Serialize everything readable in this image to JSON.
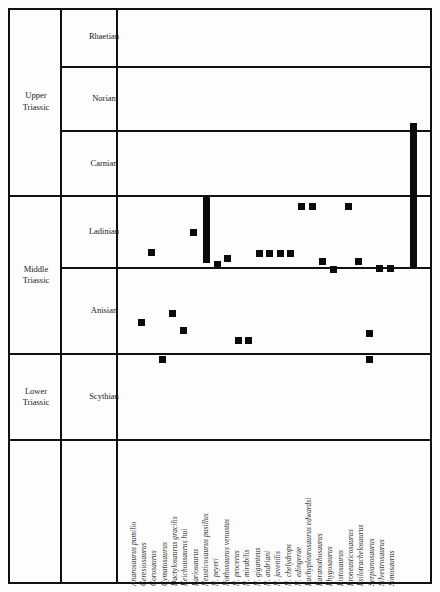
{
  "figure": {
    "background_color": "#fdfdfd",
    "line_color": "#111111",
    "mark_color": "#0b0b0b"
  },
  "axis": {
    "epochs": [
      {
        "name": "Upper\nTriassic",
        "label": "Upper Triassic",
        "line1": "Upper",
        "line2": "Triassic",
        "top": 10,
        "height": 186
      },
      {
        "name": "Middle\nTriassic",
        "label": "Middle Triassic",
        "line1": "Middle",
        "line2": "Triassic",
        "top": 196,
        "height": 158
      },
      {
        "name": "Lower\nTriassic",
        "label": "Lower Triassic",
        "line1": "Lower",
        "line2": "Triassic",
        "top": 354,
        "height": 86
      }
    ],
    "stages": [
      {
        "label": "Rhaetian",
        "top": 10,
        "height": 58
      },
      {
        "label": "Norian",
        "top": 68,
        "height": 63
      },
      {
        "label": "Carnian",
        "top": 131,
        "height": 65
      },
      {
        "label": "Ladinian",
        "top": 196,
        "height": 72
      },
      {
        "label": "Anisian",
        "top": 268,
        "height": 86
      },
      {
        "label": "Scythian",
        "top": 354,
        "height": 86
      }
    ]
  },
  "chart_data": {
    "type": "range-chart",
    "xlabel": "Taxa",
    "ylabel": "Triassic stages",
    "grid": true,
    "legend": "none",
    "y_categories": [
      "Scythian",
      "Anisian",
      "Ladinian",
      "Carnian",
      "Norian",
      "Rhaetian"
    ],
    "categories": [
      "Anarosaurus pumilio",
      "Ceresiosaurus",
      "Corosaurus",
      "Cymatosaurus",
      "Dactylosaurus gracilis",
      "Keichousaurus hui",
      "Lariosaurus",
      "Neusticosaurus pusillus",
      "N. peyeri",
      "Nothosaurus venustus",
      "N. procerus",
      "N. mirabilis",
      "N. giganteus",
      "N. andriani",
      "N. juvenilis",
      "N. chelydrops",
      "N. edingerae",
      "Pachypleurosaurus edwardsi",
      "Paranothosaurus",
      "Phygosaurus",
      "Pistosaurus",
      "Proneusticosaurus",
      "Psilotrachelosaurus",
      "Serpianosaurus",
      "Silvestrosaurus",
      "Simosaurus"
    ],
    "marks": [
      {
        "taxon": "Anarosaurus pumilio",
        "col": 0,
        "kind": "point",
        "stage": "Anisian",
        "x": 138,
        "y": 319,
        "h": 7
      },
      {
        "taxon": "Ceresiosaurus",
        "col": 1,
        "kind": "point",
        "stage": "Ladinian",
        "x": 148,
        "y": 249,
        "h": 7
      },
      {
        "taxon": "Corosaurus",
        "col": 2,
        "kind": "point",
        "stage": "Scythian",
        "x": 159,
        "y": 356,
        "h": 7
      },
      {
        "taxon": "Cymatosaurus",
        "col": 3,
        "kind": "point",
        "stage": "Anisian",
        "x": 169,
        "y": 310,
        "h": 7
      },
      {
        "taxon": "Dactylosaurus gracilis",
        "col": 4,
        "kind": "point",
        "stage": "Anisian",
        "x": 180,
        "y": 327,
        "h": 7
      },
      {
        "taxon": "Keichousaurus hui",
        "col": 5,
        "kind": "point",
        "stage": "Ladinian",
        "x": 190,
        "y": 229,
        "h": 7
      },
      {
        "taxon": "Lariosaurus",
        "col": 6,
        "kind": "range",
        "stage": "Carnian-Ladinian",
        "x": 203,
        "y": 197,
        "h": 66
      },
      {
        "taxon": "Neusticosaurus pusillus",
        "col": 7,
        "kind": "point",
        "stage": "Ladinian",
        "x": 214,
        "y": 261,
        "h": 7
      },
      {
        "taxon": "N. peyeri",
        "col": 8,
        "kind": "point",
        "stage": "Ladinian",
        "x": 224,
        "y": 255,
        "h": 7
      },
      {
        "taxon": "Nothosaurus venustus",
        "col": 9,
        "kind": "point",
        "stage": "Anisian",
        "x": 235,
        "y": 337,
        "h": 7
      },
      {
        "taxon": "N. procerus",
        "col": 10,
        "kind": "point",
        "stage": "Anisian",
        "x": 245,
        "y": 337,
        "h": 7
      },
      {
        "taxon": "N. mirabilis",
        "col": 11,
        "kind": "point",
        "stage": "Ladinian",
        "x": 256,
        "y": 250,
        "h": 7
      },
      {
        "taxon": "N. giganteus",
        "col": 12,
        "kind": "point",
        "stage": "Ladinian",
        "x": 266,
        "y": 250,
        "h": 7
      },
      {
        "taxon": "N. andriani",
        "col": 13,
        "kind": "point",
        "stage": "Ladinian",
        "x": 277,
        "y": 250,
        "h": 7
      },
      {
        "taxon": "N. juvenilis",
        "col": 14,
        "kind": "point",
        "stage": "Ladinian",
        "x": 287,
        "y": 250,
        "h": 7
      },
      {
        "taxon": "N. chelydrops",
        "col": 15,
        "kind": "point",
        "stage": "Ladinian",
        "x": 298,
        "y": 203,
        "h": 7
      },
      {
        "taxon": "N. edingerae",
        "col": 16,
        "kind": "point",
        "stage": "Ladinian",
        "x": 309,
        "y": 203,
        "h": 7
      },
      {
        "taxon": "Pachypleurosaurus edwardsi",
        "col": 17,
        "kind": "point",
        "stage": "Ladinian",
        "x": 319,
        "y": 258,
        "h": 7
      },
      {
        "taxon": "Paranothosaurus",
        "col": 18,
        "kind": "point",
        "stage": "Ladinian",
        "x": 330,
        "y": 266,
        "h": 7
      },
      {
        "taxon": "Phygosaurus",
        "col": 19,
        "kind": "point",
        "stage": "Ladinian",
        "x": 345,
        "y": 203,
        "h": 7
      },
      {
        "taxon": "Pistosaurus",
        "col": 20,
        "kind": "point",
        "stage": "Anisian",
        "x": 366,
        "y": 330,
        "h": 7
      },
      {
        "taxon": "Proneusticosaurus",
        "col": 21,
        "kind": "point",
        "stage": "Ladinian",
        "x": 355,
        "y": 258,
        "h": 7
      },
      {
        "taxon": "Psilotrachelosaurus",
        "col": 22,
        "kind": "point",
        "stage": "Ladinian",
        "x": 376,
        "y": 265,
        "h": 7
      },
      {
        "taxon": "Serpianosaurus",
        "col": 23,
        "kind": "point",
        "stage": "Ladinian",
        "x": 387,
        "y": 265,
        "h": 7
      },
      {
        "taxon": "Silvestrosaurus",
        "col": 24,
        "kind": "point",
        "stage": "Scythian",
        "x": 366,
        "y": 356,
        "h": 7
      },
      {
        "taxon": "Simosaurus",
        "col": 25,
        "kind": "range",
        "stage": "Norian-Ladinian",
        "x": 410,
        "y": 123,
        "h": 145
      }
    ]
  },
  "taxa_layout": {
    "first_x": 137.5,
    "step": 10.35,
    "baseline_y": 583,
    "label_start_y": 586
  }
}
